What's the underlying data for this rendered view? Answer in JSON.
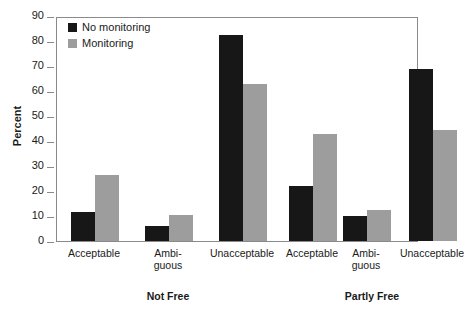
{
  "chart_data": {
    "type": "bar",
    "title": "",
    "xlabel": "",
    "ylabel": "Percent",
    "ylim": [
      0,
      90
    ],
    "yticks": [
      0,
      10,
      20,
      30,
      40,
      50,
      60,
      70,
      80,
      90
    ],
    "grid": false,
    "legend_position": "top-left",
    "categories": [
      "Acceptable",
      "Ambi-\nguous",
      "Unacceptable",
      "Acceptable",
      "Ambi-\nguous",
      "Unacceptable"
    ],
    "groups": [
      {
        "label": "Not Free",
        "categories": [
          "Acceptable",
          "Ambiguous",
          "Unacceptable"
        ]
      },
      {
        "label": "Partly Free",
        "categories": [
          "Acceptable",
          "Ambiguous",
          "Unacceptable"
        ]
      }
    ],
    "series": [
      {
        "name": "No monitoring",
        "color": "#171717",
        "values": [
          11.5,
          6.0,
          82.5,
          22.0,
          10.0,
          69.0
        ]
      },
      {
        "name": "Monitoring",
        "color": "#9d9d9d",
        "values": [
          26.5,
          10.5,
          63.0,
          43.0,
          12.5,
          44.5
        ]
      }
    ]
  },
  "legend": {
    "items": [
      {
        "label": "No monitoring",
        "swatch": "dark"
      },
      {
        "label": "Monitoring",
        "swatch": "light"
      }
    ]
  },
  "axis": {
    "y_title": "Percent",
    "y_tick_labels": [
      "90",
      "80",
      "70",
      "60",
      "50",
      "40",
      "30",
      "20",
      "10",
      "0"
    ]
  },
  "x_axis": {
    "category_labels": [
      "Acceptable",
      "Ambi-<br>guous",
      "Unacceptable",
      "Acceptable",
      "Ambi-<br>guous",
      "Unacceptable"
    ],
    "group_labels": [
      "Not Free",
      "Partly Free"
    ]
  }
}
